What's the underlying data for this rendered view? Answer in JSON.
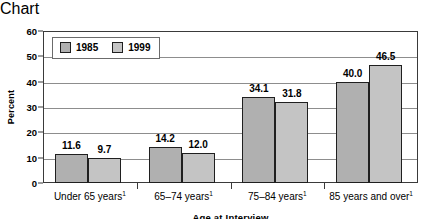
{
  "chart_data": {
    "type": "bar",
    "title": "",
    "xlabel": "Age at Interview",
    "ylabel": "Percent",
    "ylim": [
      0,
      60
    ],
    "yticks": [
      0,
      10,
      20,
      30,
      40,
      50,
      60
    ],
    "ytick_labels": [
      "0",
      "10",
      "20",
      "30",
      "40",
      "50",
      "60"
    ],
    "grid": "horizontal",
    "legend_position": "top-left",
    "categories": [
      "Under 65 years",
      "65–74 years",
      "75–84 years",
      "85 years and over"
    ],
    "category_footnote_marker": "1",
    "series": [
      {
        "name": "1985",
        "color": "#b0b0b0",
        "values": [
          11.6,
          9.7,
          34.1,
          40.0
        ],
        "value_labels": [
          "11.6",
          "9.7",
          "34.1",
          "40.0"
        ]
      },
      {
        "name": "1999",
        "color": "#c4c4c4",
        "values": [
          9.7,
          12.0,
          31.8,
          46.5
        ],
        "value_labels": [
          "9.7",
          "12.0",
          "31.8",
          "46.5"
        ]
      }
    ],
    "bars": [
      {
        "category": "Under 65 years",
        "series": "1985",
        "value": 11.6,
        "label": "11.6"
      },
      {
        "category": "Under 65 years",
        "series": "1999",
        "value": 9.7,
        "label": "9.7"
      },
      {
        "category": "65–74 years",
        "series": "1985",
        "value": 14.2,
        "label": "14.2"
      },
      {
        "category": "65–74 years",
        "series": "1999",
        "value": 12.0,
        "label": "12.0"
      },
      {
        "category": "75–84 years",
        "series": "1985",
        "value": 34.1,
        "label": "34.1"
      },
      {
        "category": "75–84 years",
        "series": "1999",
        "value": 31.8,
        "label": "31.8"
      },
      {
        "category": "85 years and over",
        "series": "1985",
        "value": 40.0,
        "label": "40.0"
      },
      {
        "category": "85 years and over",
        "series": "1999",
        "value": 46.5,
        "label": "46.5"
      }
    ]
  },
  "legend": {
    "items": [
      {
        "label": "1985",
        "color": "#b0b0b0"
      },
      {
        "label": "1999",
        "color": "#c4c4c4"
      }
    ]
  },
  "axes": {
    "y_title": "Percent",
    "x_title": "Age at Interview"
  },
  "colors": {
    "series_1985": "#b0b0b0",
    "series_1999": "#c4c4c4",
    "bar_border": "#1f1f1f",
    "gridline": "#8d8d8d",
    "frame": "#3a3a3a",
    "background": "#ffffff",
    "text": "#000000"
  }
}
